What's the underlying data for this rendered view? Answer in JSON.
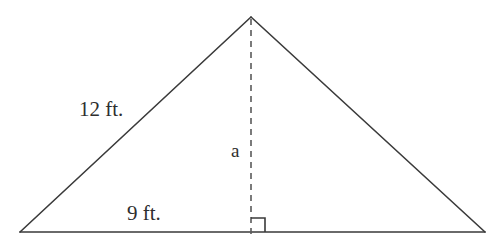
{
  "figure": {
    "type": "isosceles-triangle-with-altitude",
    "background_color": "#ffffff",
    "stroke_color": "#3a3a3a",
    "text_color": "#2e2e2e",
    "labels": {
      "left_side": "12 ft.",
      "base_segment": "9 ft.",
      "altitude": "a"
    },
    "geometry": {
      "apex": {
        "x": 251,
        "y": 17
      },
      "left_vertex": {
        "x": 20,
        "y": 232
      },
      "right_vertex": {
        "x": 485,
        "y": 232
      },
      "altitude_foot": {
        "x": 251,
        "y": 232
      },
      "altitude_dash_pattern": "6 5",
      "right_angle_marker_size": 14,
      "right_angle_marker_side": "right"
    }
  }
}
